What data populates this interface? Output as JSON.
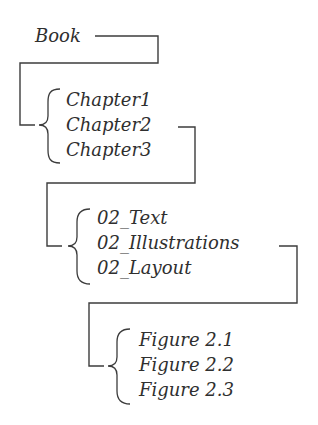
{
  "diagram": {
    "type": "hierarchy-tree",
    "root": {
      "label": "Book"
    },
    "levels": [
      {
        "parent": "Book",
        "children": [
          "Chapter1",
          "Chapter2",
          "Chapter3"
        ],
        "expanded_child": "Chapter2"
      },
      {
        "parent": "Chapter2",
        "children": [
          "02_Text",
          "02_Illustrations",
          "02_Layout"
        ],
        "expanded_child": "02_Illustrations"
      },
      {
        "parent": "02_Illustrations",
        "children": [
          "Figure 2.1",
          "Figure 2.2",
          "Figure 2.3"
        ],
        "expanded_child": null
      }
    ],
    "colors": {
      "text": "#2f2f2f",
      "lines": "#3c3c3c",
      "background": "#ffffff"
    }
  }
}
